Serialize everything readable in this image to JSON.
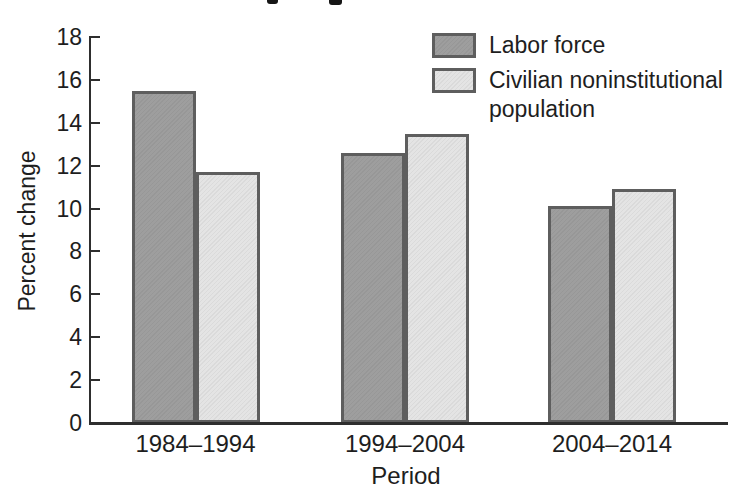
{
  "page": {
    "background": "#ffffff"
  },
  "chart_data": {
    "type": "bar",
    "categories": [
      "1984–1994",
      "1994–2004",
      "2004–2014"
    ],
    "series": [
      {
        "name": "Labor force",
        "color": "#9e9e9e",
        "values": [
          15.5,
          12.6,
          10.1
        ]
      },
      {
        "name": "Civilian noninstitutional population",
        "color": "#e4e4e4",
        "values": [
          11.7,
          13.5,
          10.9
        ]
      }
    ],
    "xlabel": "Period",
    "ylabel": "Percent change",
    "ylim": [
      0,
      18
    ],
    "ytick_step": 2,
    "grid": false,
    "legend_position": "top-right",
    "bar_border_color": "#5e5e5e",
    "axis_color": "#2e2e2e",
    "text_color": "#1e1e1e"
  }
}
